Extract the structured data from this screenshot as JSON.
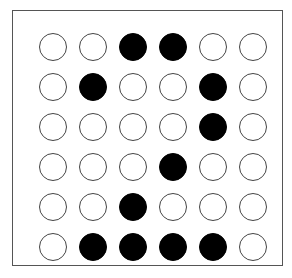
{
  "puzzle": {
    "rows": 6,
    "cols": 6,
    "filled_color": "#000000",
    "empty_color": "#ffffff",
    "grid": [
      [
        0,
        0,
        1,
        1,
        0,
        0
      ],
      [
        0,
        1,
        0,
        0,
        1,
        0
      ],
      [
        0,
        0,
        0,
        0,
        1,
        0
      ],
      [
        0,
        0,
        0,
        1,
        0,
        0
      ],
      [
        0,
        0,
        1,
        0,
        0,
        0
      ],
      [
        0,
        1,
        1,
        1,
        1,
        0
      ]
    ]
  }
}
